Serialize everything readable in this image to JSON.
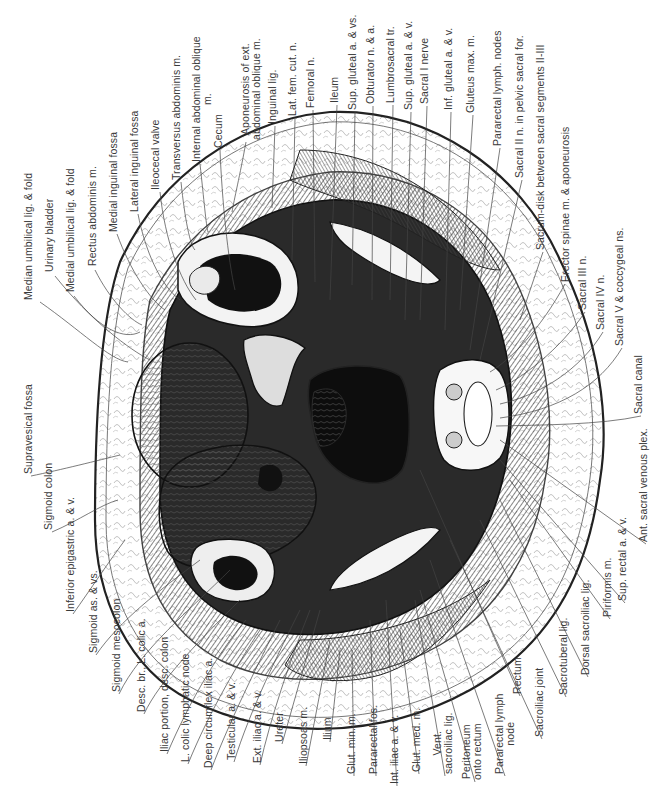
{
  "figure": {
    "orientation": "labels rotated 90 degrees counter-clockwise",
    "colors": {
      "ink": "#1a1a1a",
      "background": "#ffffff",
      "label": "#3a3a3a"
    }
  },
  "labels": {
    "top": [
      {
        "id": "median-umbilical-lig",
        "text": "Median umbilical lig. & fold",
        "x": 28,
        "y": 300
      },
      {
        "id": "urinary-bladder",
        "text": "Urinary bladder",
        "x": 49,
        "y": 272
      },
      {
        "id": "medial-umbilical-lig",
        "text": "Medial umbilical lig. & fold",
        "x": 70,
        "y": 292
      },
      {
        "id": "rectus-abdominis",
        "text": "Rectus abdominis m.",
        "x": 92,
        "y": 266
      },
      {
        "id": "medial-inguinal-fossa",
        "text": "Medial inguinal fossa",
        "x": 113,
        "y": 232
      },
      {
        "id": "lateral-inguinal-fossa",
        "text": "Lateral inguinal fossa",
        "x": 134,
        "y": 212
      },
      {
        "id": "ileocecal-valve",
        "text": "Ileocecal valve",
        "x": 155,
        "y": 190
      },
      {
        "id": "transversus-abdominis",
        "text": "Transversus abdominis m.",
        "x": 176,
        "y": 180
      },
      {
        "id": "internal-abdominal-oblique",
        "text": "Internal abdominal oblique\nm.",
        "x": 196,
        "y": 162
      },
      {
        "id": "cecum",
        "text": "Cecum",
        "x": 218,
        "y": 148
      },
      {
        "id": "aponeurosis-ext-oblique",
        "text": "Aponeurosis of ext.\nabdominal oblique m.",
        "x": 245,
        "y": 140
      },
      {
        "id": "inguinal-lig",
        "text": "Inguinal lig.",
        "x": 272,
        "y": 124
      },
      {
        "id": "lat-fem-cut-n",
        "text": "Lat. fem. cut. n.",
        "x": 292,
        "y": 116
      },
      {
        "id": "femoral-n",
        "text": "Femoral n.",
        "x": 310,
        "y": 108
      },
      {
        "id": "ileum",
        "text": "Ileum",
        "x": 334,
        "y": 103
      },
      {
        "id": "sup-gluteal-vs",
        "text": "Sup. gluteal a. & vs.",
        "x": 352,
        "y": 110
      },
      {
        "id": "obturator-n-a",
        "text": "Obturator n. & a.",
        "x": 370,
        "y": 104
      },
      {
        "id": "lumbrosacral-tr",
        "text": "Lumbrosacral tr.",
        "x": 390,
        "y": 103
      },
      {
        "id": "sup-gluteal-av",
        "text": "Sup. gluteal a. & v.",
        "x": 408,
        "y": 110
      },
      {
        "id": "sacral-i-nerve",
        "text": "Sacral I nerve",
        "x": 424,
        "y": 104
      },
      {
        "id": "inf-gluteal-av",
        "text": "Inf. gluteal a. & v.",
        "x": 448,
        "y": 110
      },
      {
        "id": "gluteus-max",
        "text": "Gluteus max. m.",
        "x": 470,
        "y": 113
      },
      {
        "id": "pararectal-lymph-nodes",
        "text": "Pararectal lymph. nodes",
        "x": 497,
        "y": 146
      },
      {
        "id": "sacral-ii-n",
        "text": "Sacral II n. in pelvic sacral for.",
        "x": 519,
        "y": 178
      },
      {
        "id": "sacrum-disk",
        "text": "Sacrum-disk between sacral segments II-III",
        "x": 540,
        "y": 250
      }
    ],
    "right": [
      {
        "id": "sacrum-disk-aponeurosis-erector",
        "text": "Erector spinae m. & aponeurosis",
        "x": 562,
        "y": 282
      },
      {
        "id": "erector-spinae",
        "text": "Erector spinae m. & aponeurosis",
        "x": 565,
        "y": 282
      },
      {
        "id": "sacral-iii-n",
        "text": "Sacral III n.",
        "x": 582,
        "y": 310
      },
      {
        "id": "sacral-iv-n",
        "text": "Sacral IV n.",
        "x": 600,
        "y": 330
      },
      {
        "id": "sacral-v-coccygeal",
        "text": "Sacral V & coccygeal ns.",
        "x": 619,
        "y": 346
      },
      {
        "id": "sacral-canal",
        "text": "Sacral canal",
        "x": 638,
        "y": 414
      }
    ],
    "left": [
      {
        "id": "supravesical-fossa",
        "text": "Supravesical fossa",
        "x": 28,
        "y": 474
      },
      {
        "id": "sigmoid-colon",
        "text": "Sigmoid colon",
        "x": 48,
        "y": 530
      },
      {
        "id": "inferior-epigastric",
        "text": "Inferior epigastric a. & v.",
        "x": 70,
        "y": 612
      }
    ],
    "bottom": [
      {
        "id": "sigmoid-as-vs",
        "text": "Sigmoid as. & vs.",
        "x": 93,
        "y": 653
      },
      {
        "id": "sigmoid-mesocolon",
        "text": "Sigmoid mesocolon",
        "x": 116,
        "y": 692
      },
      {
        "id": "desc-br-l-colic",
        "text": "Desc. br., L. colic a.",
        "x": 141,
        "y": 712
      },
      {
        "id": "iliac-portion-desc-colon",
        "text": "Iliac portion, desc. colon",
        "x": 164,
        "y": 752
      },
      {
        "id": "l-colic-lymphatic-node",
        "text": "L. colic lymphatic node",
        "x": 185,
        "y": 762
      },
      {
        "id": "deep-circumflex-iliac",
        "text": "Deep circumflex iliac a.",
        "x": 208,
        "y": 768
      },
      {
        "id": "testicular-av",
        "text": "Testicular a. & v.",
        "x": 231,
        "y": 760
      },
      {
        "id": "ext-iliac-av",
        "text": "Ext. iliac a. & v.",
        "x": 257,
        "y": 763
      },
      {
        "id": "ureter",
        "text": "Ureter",
        "x": 279,
        "y": 742
      },
      {
        "id": "iliopsoas",
        "text": "Iliopsoas m.",
        "x": 303,
        "y": 764
      },
      {
        "id": "ilium",
        "text": "Ilium",
        "x": 327,
        "y": 740
      },
      {
        "id": "glut-min",
        "text": "Glut. min. m.",
        "x": 351,
        "y": 774
      },
      {
        "id": "pararectal-fos",
        "text": "Pararectal fos.",
        "x": 373,
        "y": 774
      },
      {
        "id": "int-iliac-av",
        "text": "Int. iliac a. & v.",
        "x": 394,
        "y": 784
      },
      {
        "id": "glut-med",
        "text": "Glut. med. m.",
        "x": 416,
        "y": 772
      },
      {
        "id": "vent-sacroiliac-lig",
        "text": "Vent.\nsacroiliac lig.",
        "x": 437,
        "y": 774
      },
      {
        "id": "peritoneum-onto-rectum",
        "text": "Peritoneum\nonto rectum",
        "x": 466,
        "y": 780
      },
      {
        "id": "pararectal-lymph-node",
        "text": "Pararectal lymph\nnode",
        "x": 499,
        "y": 774
      },
      {
        "id": "rectum",
        "text": "Rectum",
        "x": 517,
        "y": 694
      },
      {
        "id": "sacroiliac-joint",
        "text": "Sacroiliac joint",
        "x": 539,
        "y": 737
      },
      {
        "id": "sacrotuberal-lig",
        "text": "Sacrotuberal lig.",
        "x": 563,
        "y": 695
      },
      {
        "id": "dorsal-sacroiliac-lig",
        "text": "Dorsal sacroiliac lig.",
        "x": 585,
        "y": 675
      },
      {
        "id": "piriformis",
        "text": "Piriformis m.",
        "x": 607,
        "y": 617
      },
      {
        "id": "sup-rectal-av",
        "text": "Sup. rectal a. & v.",
        "x": 622,
        "y": 601
      },
      {
        "id": "ant-sacral-venous-plex",
        "text": "Ant. sacral venous plex.",
        "x": 643,
        "y": 542
      }
    ]
  }
}
